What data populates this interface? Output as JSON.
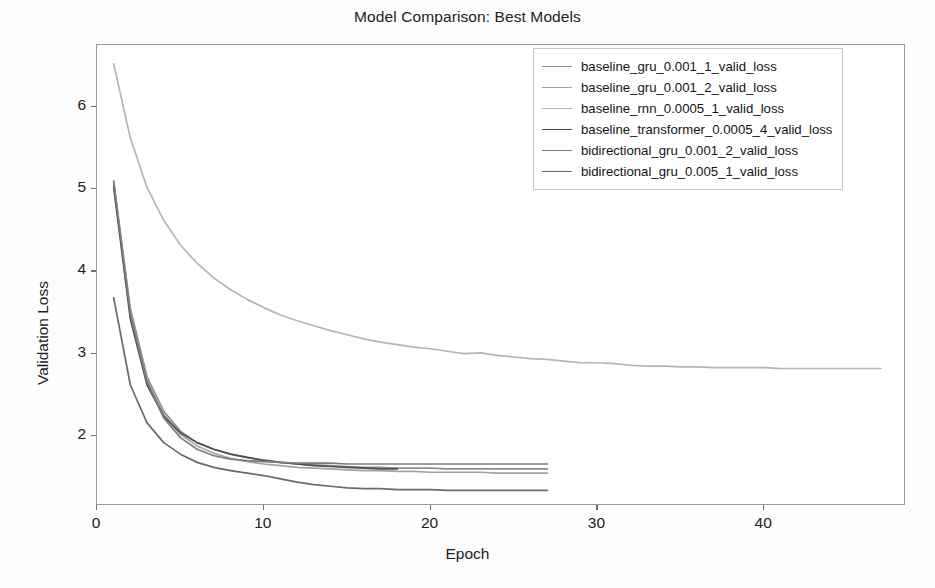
{
  "chart_data": {
    "type": "line",
    "title": "Model Comparison: Best Models",
    "xlabel": "Epoch",
    "ylabel": "Validation Loss",
    "xlim": [
      0,
      48.5
    ],
    "ylim": [
      1.15,
      6.75
    ],
    "xticks": [
      0,
      10,
      20,
      30,
      40
    ],
    "yticks": [
      2,
      3,
      4,
      5,
      6
    ],
    "grid": false,
    "legend_position": "upper right",
    "series": [
      {
        "name": "baseline_gru_0.001_1_valid_loss",
        "color": "#8d8d8d",
        "x": [
          1,
          2,
          3,
          4,
          5,
          6,
          7,
          8,
          9,
          10,
          11,
          12,
          13,
          14,
          15,
          16,
          17,
          18,
          19,
          20,
          21,
          22,
          23,
          24,
          25,
          26,
          27
        ],
        "values": [
          5.08,
          3.55,
          2.72,
          2.3,
          2.06,
          1.92,
          1.84,
          1.78,
          1.74,
          1.71,
          1.68,
          1.66,
          1.65,
          1.64,
          1.63,
          1.62,
          1.62,
          1.61,
          1.61,
          1.61,
          1.6,
          1.6,
          1.6,
          1.6,
          1.6,
          1.6,
          1.6
        ]
      },
      {
        "name": "baseline_gru_0.001_2_valid_loss",
        "color": "#a3a3a3",
        "x": [
          1,
          2,
          3,
          4,
          5,
          6,
          7,
          8,
          9,
          10,
          11,
          12,
          13,
          14,
          15,
          16,
          17,
          18,
          19,
          20,
          21,
          22,
          23,
          24,
          25,
          26,
          27
        ],
        "values": [
          5.06,
          3.5,
          2.68,
          2.26,
          2.02,
          1.88,
          1.79,
          1.73,
          1.69,
          1.66,
          1.64,
          1.62,
          1.61,
          1.6,
          1.59,
          1.58,
          1.58,
          1.57,
          1.57,
          1.56,
          1.56,
          1.56,
          1.56,
          1.55,
          1.55,
          1.55,
          1.55
        ]
      },
      {
        "name": "baseline_rnn_0.0005_1_valid_loss",
        "color": "#b5b5b5",
        "x": [
          1,
          2,
          3,
          4,
          5,
          6,
          7,
          8,
          9,
          10,
          11,
          12,
          13,
          14,
          15,
          16,
          17,
          18,
          19,
          20,
          21,
          22,
          23,
          24,
          25,
          26,
          27,
          28,
          29,
          30,
          31,
          32,
          33,
          34,
          35,
          36,
          37,
          38,
          39,
          40,
          41,
          42,
          43,
          44,
          45,
          46,
          47
        ],
        "values": [
          6.52,
          5.62,
          5.02,
          4.62,
          4.32,
          4.1,
          3.92,
          3.78,
          3.66,
          3.56,
          3.47,
          3.4,
          3.34,
          3.28,
          3.23,
          3.18,
          3.14,
          3.11,
          3.08,
          3.06,
          3.03,
          3.0,
          3.01,
          2.98,
          2.96,
          2.94,
          2.93,
          2.91,
          2.89,
          2.89,
          2.88,
          2.86,
          2.85,
          2.85,
          2.84,
          2.84,
          2.83,
          2.83,
          2.83,
          2.83,
          2.82,
          2.82,
          2.82,
          2.82,
          2.82,
          2.82,
          2.82
        ]
      },
      {
        "name": "baseline_transformer_0.0005_4_valid_loss",
        "color": "#4f4f4f",
        "x": [
          1,
          2,
          3,
          4,
          5,
          6,
          7,
          8,
          9,
          10,
          11,
          12,
          13,
          14,
          15,
          16,
          17,
          18
        ],
        "values": [
          5.02,
          3.42,
          2.62,
          2.24,
          2.04,
          1.92,
          1.84,
          1.78,
          1.74,
          1.7,
          1.68,
          1.66,
          1.64,
          1.63,
          1.62,
          1.61,
          1.6,
          1.6
        ]
      },
      {
        "name": "bidirectional_gru_0.001_2_valid_loss",
        "color": "#7c7c7c",
        "x": [
          1,
          2,
          3,
          4,
          5,
          6,
          7,
          8,
          9,
          10,
          11,
          12,
          13,
          14,
          15,
          16,
          17,
          18,
          19,
          20,
          21,
          22,
          23,
          24,
          25,
          26,
          27
        ],
        "values": [
          5.1,
          3.48,
          2.66,
          2.22,
          1.98,
          1.84,
          1.76,
          1.72,
          1.7,
          1.69,
          1.68,
          1.67,
          1.67,
          1.67,
          1.66,
          1.66,
          1.66,
          1.66,
          1.66,
          1.66,
          1.66,
          1.66,
          1.66,
          1.66,
          1.66,
          1.66,
          1.66
        ]
      },
      {
        "name": "bidirectional_gru_0.005_1_valid_loss",
        "color": "#6a6a6a",
        "x": [
          1,
          2,
          3,
          4,
          5,
          6,
          7,
          8,
          9,
          10,
          11,
          12,
          13,
          14,
          15,
          16,
          17,
          18,
          19,
          20,
          21,
          22,
          23,
          24,
          25,
          26,
          27
        ],
        "values": [
          3.68,
          2.62,
          2.16,
          1.92,
          1.78,
          1.68,
          1.62,
          1.58,
          1.55,
          1.52,
          1.48,
          1.44,
          1.41,
          1.39,
          1.37,
          1.36,
          1.36,
          1.35,
          1.35,
          1.35,
          1.34,
          1.34,
          1.34,
          1.34,
          1.34,
          1.34,
          1.34
        ]
      }
    ]
  },
  "axes": {
    "ytick_labels": [
      "6",
      "5",
      "4",
      "3",
      "2"
    ],
    "xtick_labels": [
      "0",
      "10",
      "20",
      "30",
      "40"
    ]
  }
}
